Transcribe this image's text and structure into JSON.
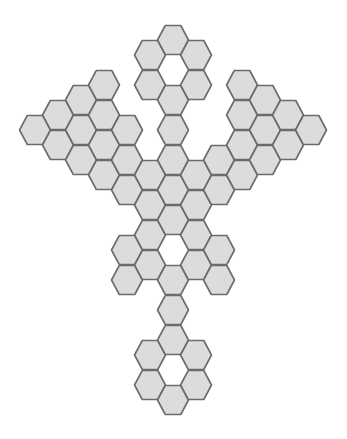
{
  "figure": {
    "hex_shape": "flat-top",
    "hex_width": 31,
    "hex_height": 29,
    "fill_color": "#dcdcdc",
    "stroke_color": "#6b6b6b",
    "stroke_width": 1.6,
    "background_color": "#ffffff"
  },
  "columns": [
    {
      "x": 35,
      "ys": [
        130
      ]
    },
    {
      "x": 58,
      "ys": [
        115,
        145
      ]
    },
    {
      "x": 81,
      "ys": [
        100,
        130,
        160
      ]
    },
    {
      "x": 104,
      "ys": [
        85,
        115,
        145,
        175
      ]
    },
    {
      "x": 127,
      "ys": [
        130,
        160,
        190,
        250,
        280
      ]
    },
    {
      "x": 150,
      "ys": [
        55,
        85,
        175,
        205,
        235,
        265,
        355,
        385
      ]
    },
    {
      "x": 173,
      "ys": [
        40,
        100,
        130,
        160,
        190,
        220,
        280,
        310,
        340,
        400
      ]
    },
    {
      "x": 196,
      "ys": [
        55,
        85,
        175,
        205,
        235,
        265,
        355,
        385
      ]
    },
    {
      "x": 219,
      "ys": [
        160,
        190,
        250,
        280
      ]
    },
    {
      "x": 242,
      "ys": [
        85,
        115,
        145,
        175
      ]
    },
    {
      "x": 265,
      "ys": [
        100,
        130,
        160
      ]
    },
    {
      "x": 288,
      "ys": [
        115,
        145
      ]
    },
    {
      "x": 311,
      "ys": [
        130
      ]
    }
  ]
}
